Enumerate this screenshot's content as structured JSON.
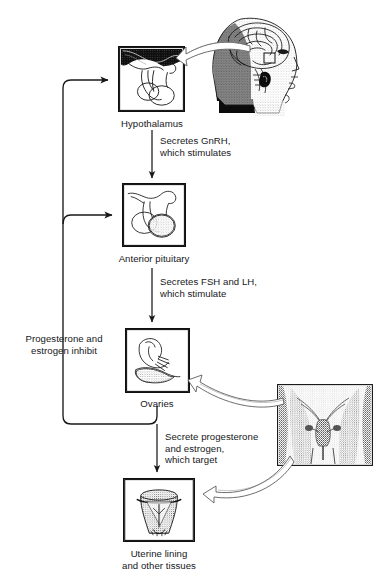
{
  "diagram": {
    "type": "flow-diagram",
    "background_color": "#ffffff",
    "ink_color": "#16181a"
  },
  "nodes": {
    "hypothalamus": {
      "label": "Hypothalamus",
      "icon": "hypothalamus-illustration"
    },
    "anterior_pituitary": {
      "label": "Anterior pituitary",
      "icon": "pituitary-illustration"
    },
    "ovaries": {
      "label": "Ovaries",
      "icon": "ovary-illustration"
    },
    "uterine_lining": {
      "label": "Uterine lining\nand other tissues",
      "icon": "uterus-illustration"
    }
  },
  "photos": {
    "head": {
      "label": "head-brain-photograph",
      "icon": "head-sagittal-photo"
    },
    "pelvis": {
      "label": "pelvis-photograph",
      "icon": "pelvis-radiograph-photo"
    }
  },
  "arrows": [
    {
      "id": "gnrh",
      "from": "hypothalamus",
      "to": "anterior_pituitary",
      "label": "Secretes GnRH,\nwhich stimulates",
      "direction": "down"
    },
    {
      "id": "fsh-lh",
      "from": "anterior_pituitary",
      "to": "ovaries",
      "label": "Secretes FSH and LH,\nwhich stimulate",
      "direction": "down"
    },
    {
      "id": "prog-estro",
      "from": "ovaries",
      "to": "uterine_lining",
      "label": "Secrete progesterone\nand estrogen,\nwhich target",
      "direction": "down"
    },
    {
      "id": "feedback",
      "from": "ovaries",
      "to": "hypothalamus and anterior_pituitary",
      "label": "Progesterone and\nestrogen inhibit",
      "direction": "feedback-loop-left"
    }
  ],
  "pointers": [
    {
      "id": "head-to-hypothalamus",
      "from": "head",
      "to": "hypothalamus",
      "style": "hollow-curved-arrow"
    },
    {
      "id": "pelvis-to-ovaries",
      "from": "pelvis",
      "to": "ovaries",
      "style": "hollow-curved-arrow"
    },
    {
      "id": "pelvis-to-uterus",
      "from": "pelvis",
      "to": "uterine_lining",
      "style": "hollow-curved-arrow"
    }
  ]
}
